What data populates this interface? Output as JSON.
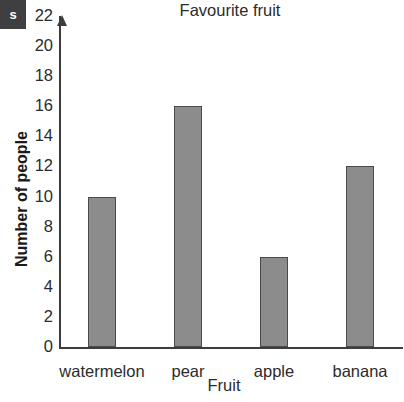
{
  "badge": {
    "text": "s"
  },
  "chart_data": {
    "type": "bar",
    "title": "Favourite fruit",
    "xlabel": "Fruit",
    "ylabel": "Number of people",
    "categories": [
      "watermelon",
      "pear",
      "apple",
      "banana"
    ],
    "values": [
      10,
      16,
      6,
      12
    ],
    "ylim": [
      0,
      22
    ],
    "ytick_step": 2,
    "yticks": [
      0,
      2,
      4,
      6,
      8,
      10,
      12,
      14,
      16,
      18,
      20,
      22
    ],
    "ytick_labels": [
      "0",
      "2",
      "4",
      "6",
      "8",
      "10",
      "12",
      "14",
      "16",
      "18",
      "20",
      "22"
    ],
    "grid": "horizontal",
    "legend": "none",
    "bar_color": "#8c8c8c",
    "bar_edge_color": "#4a4a4a",
    "axis_color": "#3c3c3c",
    "gridline_color": "#58595b"
  }
}
